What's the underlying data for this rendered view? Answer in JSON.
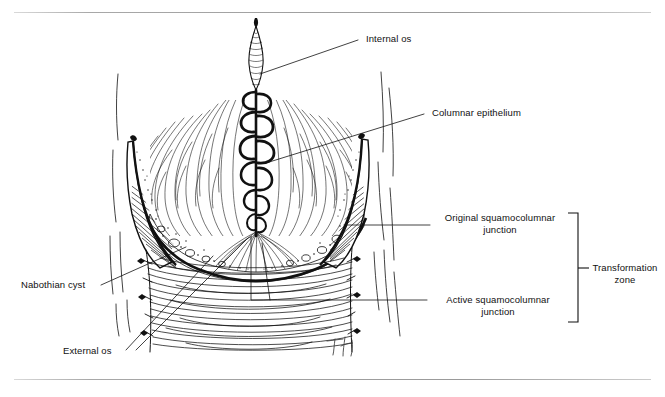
{
  "figure": {
    "kind": "anatomical-line-drawing",
    "signature": "T.H."
  },
  "labels": {
    "internal_os": "Internal os",
    "columnar_epithelium": "Columnar epithelium",
    "original_scj_line1": "Original squamocolumnar",
    "original_scj_line2": "junction",
    "active_scj_line1": "Active squamocolumnar",
    "active_scj_line2": "junction",
    "transformation_line1": "Transformation",
    "transformation_line2": "zone",
    "nabothian_cyst": "Nabothian cyst",
    "external_os": "External os"
  },
  "colors": {
    "ink": "#111111",
    "paper": "#ffffff",
    "rule": "#9a9a9a"
  }
}
